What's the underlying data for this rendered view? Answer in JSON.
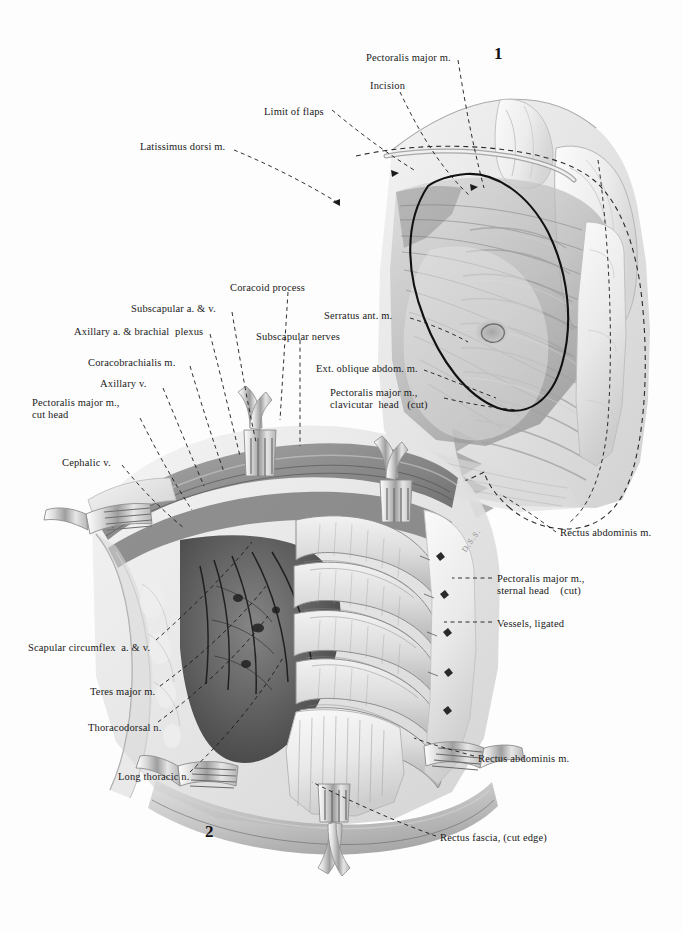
{
  "plate": {
    "title": "Radical mastectomy — surgical anatomy plate",
    "background_color": "#fdfdfd",
    "ink_color": "#1a1a1a",
    "signature": "D.S.S."
  },
  "figures": [
    {
      "id": "fig1",
      "number": "1",
      "caption": "Chest wall, incision and limit of flaps"
    },
    {
      "id": "fig2",
      "number": "2",
      "caption": "Axillary dissection after removal of pectoralis major"
    }
  ],
  "labels": [
    {
      "id": "pectoralis-major-m",
      "text": "Pectoralis major m.",
      "x": 366,
      "y": 52,
      "align": "left"
    },
    {
      "id": "incision",
      "text": "Incision",
      "x": 370,
      "y": 80,
      "align": "left"
    },
    {
      "id": "limit-of-flaps",
      "text": "Limit of flaps",
      "x": 264,
      "y": 106,
      "align": "left"
    },
    {
      "id": "latissimus-dorsi-m",
      "text": "Latissimus dorsi m.",
      "x": 140,
      "y": 141,
      "align": "left"
    },
    {
      "id": "coracoid-process",
      "text": "Coracoid process",
      "x": 230,
      "y": 282,
      "align": "left"
    },
    {
      "id": "subscapular-a-v",
      "text": "Subscapular a. & v.",
      "x": 131,
      "y": 303,
      "align": "left"
    },
    {
      "id": "axillary-a-brachial-plexus",
      "text": "Axillary a. & brachial  plexus",
      "x": 74,
      "y": 326,
      "align": "left"
    },
    {
      "id": "serratus-ant-m",
      "text": "Serratus ant. m.",
      "x": 324,
      "y": 310,
      "align": "left"
    },
    {
      "id": "subscapular-nerves",
      "text": "Subscapular nerves",
      "x": 256,
      "y": 331,
      "align": "left"
    },
    {
      "id": "coracobrachialis-m",
      "text": "Coracobrachialis m.",
      "x": 88,
      "y": 357,
      "align": "left"
    },
    {
      "id": "ext-oblique-abdom-m",
      "text": "Ext. oblique abdom. m.",
      "x": 316,
      "y": 363,
      "align": "left"
    },
    {
      "id": "axillary-v",
      "text": "Axillary v.",
      "x": 100,
      "y": 378,
      "align": "left"
    },
    {
      "id": "pectoralis-major-clavicular",
      "text": "Pectoralis major m.,\nclavicutar  head   (cut)",
      "x": 330,
      "y": 387,
      "align": "left"
    },
    {
      "id": "pectoralis-major-cut-head",
      "text": "Pectoralis major m.,\ncut head",
      "x": 32,
      "y": 397,
      "align": "left"
    },
    {
      "id": "cephalic-v",
      "text": "Cephalic v.",
      "x": 62,
      "y": 457,
      "align": "left"
    },
    {
      "id": "rectus-abdominis-m-upper",
      "text": "Rectus abdominis m.",
      "x": 560,
      "y": 527,
      "align": "left"
    },
    {
      "id": "pectoralis-major-sternal",
      "text": "Pectoralis major m.,\nsternal head    (cut)",
      "x": 497,
      "y": 573,
      "align": "left"
    },
    {
      "id": "vessels-ligated",
      "text": "Vessels, ligated",
      "x": 497,
      "y": 618,
      "align": "left"
    },
    {
      "id": "scapular-circumflex-a-v",
      "text": "Scapular circumflex  a. & v.",
      "x": 28,
      "y": 642,
      "align": "left"
    },
    {
      "id": "teres-major-m",
      "text": "Teres major m.",
      "x": 90,
      "y": 686,
      "align": "left"
    },
    {
      "id": "thoracodorsal-n",
      "text": "Thoracodorsal n.",
      "x": 88,
      "y": 722,
      "align": "left"
    },
    {
      "id": "long-thoracic-n",
      "text": "Long thoracic n.",
      "x": 118,
      "y": 771,
      "align": "left"
    },
    {
      "id": "rectus-abdominis-m-lower",
      "text": "Rectus abdominis m.",
      "x": 478,
      "y": 753,
      "align": "left"
    },
    {
      "id": "rectus-fascia-cut-edge",
      "text": "Rectus fascia, (cut edge)",
      "x": 440,
      "y": 832,
      "align": "left"
    }
  ],
  "figure_numbers": [
    {
      "id": "fig1-number",
      "text": "1",
      "x": 494,
      "y": 48
    },
    {
      "id": "fig2-number",
      "text": "2",
      "x": 205,
      "y": 828
    }
  ],
  "signature": {
    "text": "D.S.S.",
    "x": 462,
    "y": 538
  }
}
